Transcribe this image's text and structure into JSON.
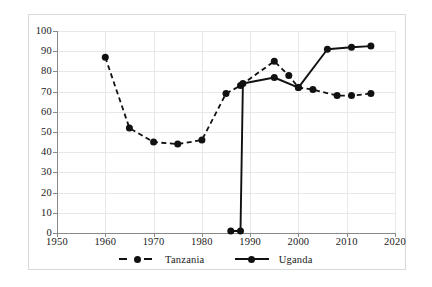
{
  "chart_data": {
    "type": "line",
    "title": "",
    "subtitle": "",
    "xlabel": "",
    "ylabel": "",
    "xlim": [
      1950,
      2020
    ],
    "ylim": [
      0,
      100
    ],
    "xticks": [
      1950,
      1960,
      1970,
      1980,
      1990,
      2000,
      2010,
      2020
    ],
    "yticks": [
      0,
      10,
      20,
      30,
      40,
      50,
      60,
      70,
      80,
      90,
      100
    ],
    "grid": true,
    "legend_position": "bottom-center",
    "series": [
      {
        "name": "Tanzania",
        "style": "dashed",
        "marker": "circle",
        "color": "#111111",
        "points": [
          {
            "x": 1960,
            "y": 87
          },
          {
            "x": 1965,
            "y": 52
          },
          {
            "x": 1970,
            "y": 45
          },
          {
            "x": 1975,
            "y": 44
          },
          {
            "x": 1980,
            "y": 46
          },
          {
            "x": 1985,
            "y": 69
          },
          {
            "x": 1988,
            "y": 73
          },
          {
            "x": 1995,
            "y": 85
          },
          {
            "x": 1998,
            "y": 78
          },
          {
            "x": 2000,
            "y": 72
          },
          {
            "x": 2003,
            "y": 71
          },
          {
            "x": 2008,
            "y": 68
          },
          {
            "x": 2011,
            "y": 68
          },
          {
            "x": 2015,
            "y": 69
          }
        ]
      },
      {
        "name": "Uganda",
        "style": "solid",
        "marker": "circle",
        "color": "#111111",
        "points": [
          {
            "x": 1986,
            "y": 1
          },
          {
            "x": 1988,
            "y": 1
          },
          {
            "x": 1988.5,
            "y": 74
          },
          {
            "x": 1995,
            "y": 77
          },
          {
            "x": 2000,
            "y": 72
          },
          {
            "x": 2006,
            "y": 91
          },
          {
            "x": 2011,
            "y": 92
          },
          {
            "x": 2015,
            "y": 92.5
          }
        ]
      }
    ]
  },
  "legend": {
    "items": [
      {
        "label": "Tanzania"
      },
      {
        "label": "Uganda"
      }
    ]
  },
  "colors": {
    "series": "#111111",
    "grid": "#e8e8e8",
    "axis": "#8a8a8a",
    "text": "#1a1a1a",
    "background": "#ffffff",
    "card_border": "#d9d9d9"
  }
}
